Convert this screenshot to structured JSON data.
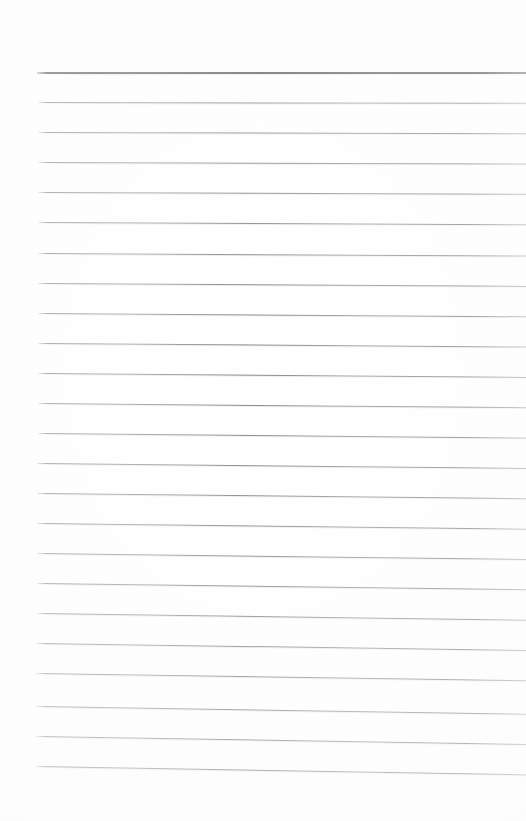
{
  "page": {
    "kind": "blank-lined-paper-scan",
    "width": 526,
    "height": 821,
    "background_color": "#ffffff",
    "has_text": false,
    "has_handwriting": false,
    "visible_text": ""
  },
  "ruling": {
    "line_count": 24,
    "first_line_y": 72,
    "last_line_y": 766,
    "line_spacing": 30,
    "left_margin_x": 37,
    "right_edge_x": 526,
    "top_margin_height": 72,
    "bottom_margin_height": 55,
    "line_color": "#80808a",
    "header_line_color": "#5e5e64",
    "header_line_thickness": 2,
    "body_line_thickness": 1
  },
  "lines": [
    {
      "index": 1,
      "y": 72,
      "x_start": 37,
      "x_end": 526,
      "slant": 0.0,
      "emphasis": "header"
    },
    {
      "index": 2,
      "y": 102,
      "x_start": 38,
      "x_end": 526,
      "slant": 0.1,
      "emphasis": "body"
    },
    {
      "index": 3,
      "y": 132,
      "x_start": 38,
      "x_end": 526,
      "slant": 0.14,
      "emphasis": "body"
    },
    {
      "index": 4,
      "y": 162,
      "x_start": 38,
      "x_end": 526,
      "slant": 0.18,
      "emphasis": "body"
    },
    {
      "index": 5,
      "y": 192,
      "x_start": 38,
      "x_end": 526,
      "slant": 0.22,
      "emphasis": "body"
    },
    {
      "index": 6,
      "y": 222,
      "x_start": 38,
      "x_end": 526,
      "slant": 0.26,
      "emphasis": "body"
    },
    {
      "index": 7,
      "y": 253,
      "x_start": 38,
      "x_end": 526,
      "slant": 0.3,
      "emphasis": "body"
    },
    {
      "index": 8,
      "y": 283,
      "x_start": 38,
      "x_end": 526,
      "slant": 0.34,
      "emphasis": "body"
    },
    {
      "index": 9,
      "y": 313,
      "x_start": 38,
      "x_end": 526,
      "slant": 0.38,
      "emphasis": "body"
    },
    {
      "index": 10,
      "y": 343,
      "x_start": 38,
      "x_end": 526,
      "slant": 0.42,
      "emphasis": "body"
    },
    {
      "index": 11,
      "y": 373,
      "x_start": 38,
      "x_end": 526,
      "slant": 0.46,
      "emphasis": "body"
    },
    {
      "index": 12,
      "y": 403,
      "x_start": 38,
      "x_end": 526,
      "slant": 0.5,
      "emphasis": "body"
    },
    {
      "index": 13,
      "y": 433,
      "x_start": 38,
      "x_end": 526,
      "slant": 0.54,
      "emphasis": "body"
    },
    {
      "index": 14,
      "y": 463,
      "x_start": 37,
      "x_end": 526,
      "slant": 0.58,
      "emphasis": "body"
    },
    {
      "index": 15,
      "y": 493,
      "x_start": 37,
      "x_end": 526,
      "slant": 0.62,
      "emphasis": "body"
    },
    {
      "index": 16,
      "y": 523,
      "x_start": 37,
      "x_end": 526,
      "slant": 0.66,
      "emphasis": "body"
    },
    {
      "index": 17,
      "y": 553,
      "x_start": 37,
      "x_end": 526,
      "slant": 0.7,
      "emphasis": "body"
    },
    {
      "index": 18,
      "y": 583,
      "x_start": 37,
      "x_end": 526,
      "slant": 0.74,
      "emphasis": "body"
    },
    {
      "index": 19,
      "y": 613,
      "x_start": 37,
      "x_end": 526,
      "slant": 0.78,
      "emphasis": "body"
    },
    {
      "index": 20,
      "y": 643,
      "x_start": 36,
      "x_end": 526,
      "slant": 0.82,
      "emphasis": "body"
    },
    {
      "index": 21,
      "y": 673,
      "x_start": 36,
      "x_end": 526,
      "slant": 0.86,
      "emphasis": "body"
    },
    {
      "index": 22,
      "y": 706,
      "x_start": 36,
      "x_end": 526,
      "slant": 0.9,
      "emphasis": "body"
    },
    {
      "index": 23,
      "y": 736,
      "x_start": 36,
      "x_end": 526,
      "slant": 0.94,
      "emphasis": "body"
    },
    {
      "index": 24,
      "y": 766,
      "x_start": 36,
      "x_end": 526,
      "slant": 0.98,
      "emphasis": "body"
    }
  ]
}
